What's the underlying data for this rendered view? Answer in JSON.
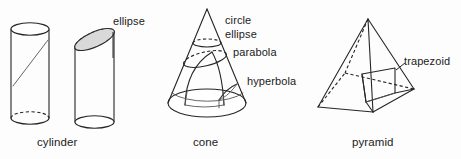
{
  "figure": {
    "background_color": "#fdfdfd",
    "line_color": "#262626",
    "shade_color": "#d9d9d9"
  },
  "shapes": [
    {
      "id": "cylinder",
      "name_label": "cylinder",
      "cross_sections": [
        {
          "id": "cyl-diagonal",
          "label": "",
          "style": "solid-thin"
        },
        {
          "id": "cyl-ellipse",
          "label": "ellipse",
          "style": "shaded"
        }
      ]
    },
    {
      "id": "cone",
      "name_label": "cone",
      "cross_sections": [
        {
          "id": "cone-circle",
          "label": "circle",
          "style": "horizontal"
        },
        {
          "id": "cone-ellipse",
          "label": "ellipse",
          "style": "oblique"
        },
        {
          "id": "cone-parabola",
          "label": "parabola",
          "style": "parallel-to-side"
        },
        {
          "id": "cone-hyperbola",
          "label": "hyperbola",
          "style": "vertical"
        }
      ]
    },
    {
      "id": "pyramid",
      "name_label": "pyramid",
      "cross_sections": [
        {
          "id": "pyr-trapezoid",
          "label": "trapezoid",
          "style": "oblique-plane"
        }
      ]
    }
  ],
  "labels": {
    "cylinder_ellipse": "ellipse",
    "cylinder_name": "cylinder",
    "cone_circle": "circle",
    "cone_ellipse": "ellipse",
    "cone_parabola": "parabola",
    "cone_hyperbola": "hyperbola",
    "cone_name": "cone",
    "pyramid_trapezoid": "trapezoid",
    "pyramid_name": "pyramid"
  }
}
